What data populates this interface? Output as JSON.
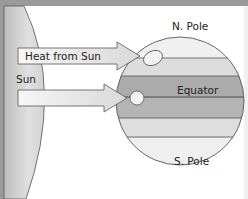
{
  "diagram": {
    "labels": {
      "heat_arrow": "Heat from Sun",
      "sun": "Sun",
      "north_pole": "N. Pole",
      "equator": "Equator",
      "south_pole": "S. Pole"
    },
    "colors": {
      "border": "#9a9a9a",
      "sun_fill": "#d8d8d8",
      "arrow_fill": "#ececec",
      "band_light": "#e6e6e6",
      "band_mid": "#d0d0d0",
      "band_dark": "#a8a8a8",
      "outline": "#555555"
    }
  }
}
